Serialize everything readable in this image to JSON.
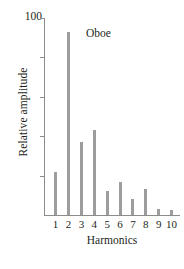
{
  "chart_data": {
    "type": "bar",
    "title": "Oboe",
    "xlabel": "Harmonics",
    "ylabel": "Relative amplitude",
    "categories": [
      "1",
      "2",
      "3",
      "4",
      "5",
      "6",
      "7",
      "8",
      "9",
      "10"
    ],
    "values": [
      22,
      93,
      37,
      43,
      12,
      17,
      8,
      13,
      3,
      2.5
    ],
    "ylim": [
      0,
      100
    ],
    "y_tick_labels": [
      "100"
    ],
    "y_tick_values": [
      100,
      80,
      60,
      40,
      20
    ],
    "grid": false,
    "legend": false,
    "bar_color": "#9d9d9d",
    "axis_color": "#8c8c8c",
    "text_color": "#231f20",
    "background": "#ffffff"
  },
  "figure": {
    "top_tick_label": "100"
  }
}
